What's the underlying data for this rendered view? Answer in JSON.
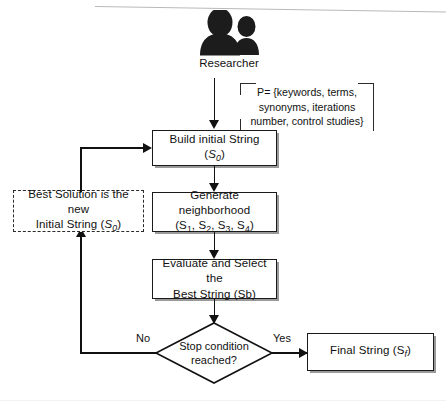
{
  "diagram": {
    "actor": {
      "icon": "two-people-silhouette-icon",
      "label": "Researcher"
    },
    "note": {
      "text": "P= {keywords, terms, synonyms, iterations number, control studies}"
    },
    "nodes": [
      {
        "id": "build-initial-string",
        "label": "Build initial String (S0)",
        "label_main": "Build initial String (",
        "label_var": "S",
        "label_sub": "0",
        "label_tail": ")",
        "shape": "process"
      },
      {
        "id": "generate-neighborhood",
        "label": "Generate neighborhood (S1, S2, S3, S4)",
        "line1": "Generate neighborhood",
        "line2": "(S1, S2, S3, S4)",
        "shape": "process"
      },
      {
        "id": "evaluate-select-best",
        "label": "Evaluate and Select the Best String (Sb)",
        "line1": "Evaluate and Select the",
        "line2": "Best String (Sb)",
        "shape": "process"
      },
      {
        "id": "best-solution-new-initial",
        "label": "Best Solution is the new Initial String (S0)",
        "line1": "Best Solution is the new",
        "line2": "Initial String (S0)",
        "shape": "process-dashed"
      },
      {
        "id": "stop-condition",
        "label": "Stop condition reached?",
        "line1": "Stop condition",
        "line2": "reached?",
        "shape": "decision"
      },
      {
        "id": "final-string",
        "label": "Final String (Sf)",
        "label_main": "Final String (S",
        "label_sub": "f",
        "label_tail": ")",
        "shape": "process"
      }
    ],
    "edge_labels": {
      "no": "No",
      "yes": "Yes"
    },
    "colors": {
      "stroke": "#111111",
      "fill": "#ffffff",
      "shadow": "#9a9a9a",
      "silhouette": "#1c1c1c"
    }
  }
}
